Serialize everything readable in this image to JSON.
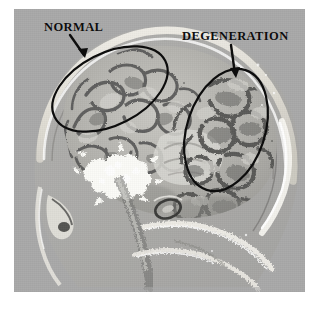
{
  "figure": {
    "kind": "annotated-medical-image",
    "modality": "sagittal brain section (grayscale photomicrograph / scan)",
    "plate_background_color": "#a9a9a9",
    "page_background_color": "#ffffff",
    "annotation_color": "#0d0d0d"
  },
  "annotations": [
    {
      "id": "normal",
      "label": "NORMAL",
      "region": "left upper (frontal) cortex",
      "marker": "ellipse",
      "pointer": "arrow",
      "label_x": 44,
      "label_y": 21,
      "ellipse": {
        "cx": 110,
        "cy": 89,
        "rx": 62,
        "ry": 36,
        "rotation_deg": -27
      },
      "arrow": {
        "x1": 70,
        "y1": 35,
        "x2": 85,
        "y2": 58
      }
    },
    {
      "id": "degeneration",
      "label": "DEGENERATION",
      "region": "right posterior (parieto-occipital) cortex",
      "marker": "ellipse",
      "pointer": "arrow",
      "label_x": 182,
      "label_y": 30,
      "ellipse": {
        "cx": 226,
        "cy": 130,
        "rx": 39,
        "ry": 63,
        "rotation_deg": 18
      },
      "arrow": {
        "x1": 231,
        "y1": 45,
        "x2": 236,
        "y2": 77
      }
    }
  ],
  "image_features": {
    "skull_highlight_color": "#f2f0ea",
    "cortex_light_color": "#c6c5c0",
    "cortex_mid_color": "#9a9a96",
    "sulci_dark_color": "#5f5f5d",
    "white_matter_bright_color": "#fbfbf7",
    "background_gray": "#a9a9a9",
    "bright_cluster": "arbor-vitae / calcified branching cluster (lower left of brain)",
    "face_region": "nasal and facial bones with speckled bright bands (lower left)",
    "skull_base": "bright speckled curvilinear bands (lower centre-right)"
  }
}
